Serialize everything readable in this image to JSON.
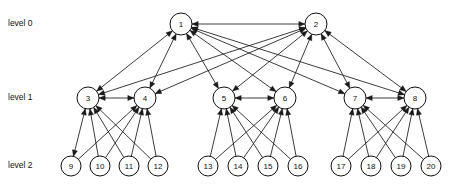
{
  "figure": {
    "type": "hierarchical-graph-diagram",
    "background_color": "#ffffff",
    "edge_color": "#1a1a1a",
    "node_fill": "#ffffff",
    "node_stroke": "#111111",
    "node_radius": 11,
    "leaf_radius": 10
  },
  "levels": [
    {
      "id": "level-0",
      "label": "level 0",
      "y": 24,
      "label_x": 8,
      "label_y": 26
    },
    {
      "id": "level-1",
      "label": "level 1",
      "y": 98,
      "label_x": 8,
      "label_y": 100
    },
    {
      "id": "level-2",
      "label": "level 2",
      "y": 166,
      "label_x": 8,
      "label_y": 168
    }
  ],
  "nodes": [
    {
      "id": 1,
      "label": "1",
      "level": 0,
      "x": 181,
      "y": 24,
      "r": 11
    },
    {
      "id": 2,
      "label": "2",
      "level": 0,
      "x": 316,
      "y": 24,
      "r": 11
    },
    {
      "id": 3,
      "label": "3",
      "level": 1,
      "x": 88,
      "y": 98,
      "r": 11
    },
    {
      "id": 4,
      "label": "4",
      "level": 1,
      "x": 145,
      "y": 98,
      "r": 11
    },
    {
      "id": 5,
      "label": "5",
      "level": 1,
      "x": 224,
      "y": 98,
      "r": 11
    },
    {
      "id": 6,
      "label": "6",
      "level": 1,
      "x": 285,
      "y": 98,
      "r": 11
    },
    {
      "id": 7,
      "label": "7",
      "level": 1,
      "x": 355,
      "y": 98,
      "r": 11
    },
    {
      "id": 8,
      "label": "8",
      "level": 1,
      "x": 415,
      "y": 98,
      "r": 11
    },
    {
      "id": 9,
      "label": "9",
      "level": 2,
      "x": 71,
      "y": 166,
      "r": 10
    },
    {
      "id": 10,
      "label": "10",
      "level": 2,
      "x": 100,
      "y": 166,
      "r": 10
    },
    {
      "id": 11,
      "label": "11",
      "level": 2,
      "x": 129,
      "y": 166,
      "r": 10
    },
    {
      "id": 12,
      "label": "12",
      "level": 2,
      "x": 158,
      "y": 166,
      "r": 10
    },
    {
      "id": 13,
      "label": "13",
      "level": 2,
      "x": 208,
      "y": 166,
      "r": 10
    },
    {
      "id": 14,
      "label": "14",
      "level": 2,
      "x": 238,
      "y": 166,
      "r": 10
    },
    {
      "id": 15,
      "label": "15",
      "level": 2,
      "x": 268,
      "y": 166,
      "r": 10
    },
    {
      "id": 16,
      "label": "16",
      "level": 2,
      "x": 298,
      "y": 166,
      "r": 10
    },
    {
      "id": 17,
      "label": "17",
      "level": 2,
      "x": 341,
      "y": 166,
      "r": 10
    },
    {
      "id": 18,
      "label": "18",
      "level": 2,
      "x": 371,
      "y": 166,
      "r": 10
    },
    {
      "id": 19,
      "label": "19",
      "level": 2,
      "x": 401,
      "y": 166,
      "r": 10
    },
    {
      "id": 20,
      "label": "20",
      "level": 2,
      "x": 431,
      "y": 166,
      "r": 10
    }
  ],
  "edges": [
    {
      "from": 1,
      "to": 2,
      "arrows": "both"
    },
    {
      "from": 1,
      "to": 3,
      "arrows": "both"
    },
    {
      "from": 1,
      "to": 4,
      "arrows": "both"
    },
    {
      "from": 1,
      "to": 5,
      "arrows": "both"
    },
    {
      "from": 1,
      "to": 6,
      "arrows": "both"
    },
    {
      "from": 1,
      "to": 7,
      "arrows": "both"
    },
    {
      "from": 1,
      "to": 8,
      "arrows": "both"
    },
    {
      "from": 2,
      "to": 3,
      "arrows": "both"
    },
    {
      "from": 2,
      "to": 4,
      "arrows": "both"
    },
    {
      "from": 2,
      "to": 5,
      "arrows": "both"
    },
    {
      "from": 2,
      "to": 6,
      "arrows": "both"
    },
    {
      "from": 2,
      "to": 7,
      "arrows": "both"
    },
    {
      "from": 2,
      "to": 8,
      "arrows": "both"
    },
    {
      "from": 3,
      "to": 4,
      "arrows": "both"
    },
    {
      "from": 5,
      "to": 6,
      "arrows": "both"
    },
    {
      "from": 7,
      "to": 8,
      "arrows": "both"
    },
    {
      "from": 3,
      "to": 9,
      "arrows": "both"
    },
    {
      "from": 3,
      "to": 10,
      "arrows": "to-upper"
    },
    {
      "from": 3,
      "to": 11,
      "arrows": "to-upper"
    },
    {
      "from": 3,
      "to": 12,
      "arrows": "to-upper"
    },
    {
      "from": 4,
      "to": 9,
      "arrows": "to-upper"
    },
    {
      "from": 4,
      "to": 10,
      "arrows": "to-upper"
    },
    {
      "from": 4,
      "to": 11,
      "arrows": "to-upper"
    },
    {
      "from": 4,
      "to": 12,
      "arrows": "to-upper"
    },
    {
      "from": 5,
      "to": 13,
      "arrows": "to-upper"
    },
    {
      "from": 5,
      "to": 14,
      "arrows": "to-upper"
    },
    {
      "from": 5,
      "to": 15,
      "arrows": "to-upper"
    },
    {
      "from": 5,
      "to": 16,
      "arrows": "to-upper"
    },
    {
      "from": 6,
      "to": 13,
      "arrows": "to-upper"
    },
    {
      "from": 6,
      "to": 14,
      "arrows": "to-upper"
    },
    {
      "from": 6,
      "to": 15,
      "arrows": "to-upper"
    },
    {
      "from": 6,
      "to": 16,
      "arrows": "to-upper"
    },
    {
      "from": 7,
      "to": 17,
      "arrows": "to-upper"
    },
    {
      "from": 7,
      "to": 18,
      "arrows": "to-upper"
    },
    {
      "from": 7,
      "to": 19,
      "arrows": "to-upper"
    },
    {
      "from": 7,
      "to": 20,
      "arrows": "to-upper"
    },
    {
      "from": 8,
      "to": 17,
      "arrows": "to-upper"
    },
    {
      "from": 8,
      "to": 18,
      "arrows": "to-upper"
    },
    {
      "from": 8,
      "to": 19,
      "arrows": "to-upper"
    },
    {
      "from": 8,
      "to": 20,
      "arrows": "to-upper"
    }
  ]
}
